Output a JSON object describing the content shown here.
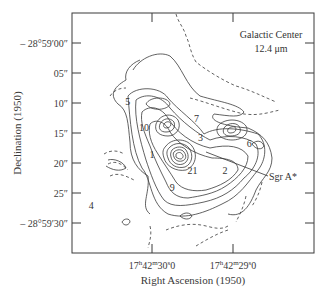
{
  "chart_data": {
    "type": "contour",
    "title": "Galactic Center",
    "subtitle": "12.4 μm",
    "xlabel": "Right Ascension (1950)",
    "ylabel": "Declination (1950)",
    "x_ticks": [
      {
        "label": "17h42m30s0",
        "sup_h": "h",
        "sup_m": "m",
        "sup_s": "s",
        "display": [
          "17",
          "h",
          "42",
          "m",
          "30",
          "s",
          "0"
        ],
        "ra_seconds": 30.0
      },
      {
        "label": "17h42m29s0",
        "display": [
          "17",
          "h",
          "42",
          "m",
          "29",
          "s",
          "0"
        ],
        "ra_seconds": 29.0
      }
    ],
    "y_ticks": [
      {
        "label": "– 28°59′00″",
        "dec_arcsec": 0
      },
      {
        "label": "05″",
        "dec_arcsec": 5
      },
      {
        "label": "10″",
        "dec_arcsec": 10
      },
      {
        "label": "15″",
        "dec_arcsec": 15
      },
      {
        "label": "20″",
        "dec_arcsec": 20
      },
      {
        "label": "25″",
        "dec_arcsec": 25
      },
      {
        "label": "– 28°59′30″",
        "dec_arcsec": 30
      }
    ],
    "xlim_ra_seconds": [
      30.95,
      28.3
    ],
    "ylim_dec_arcsec": [
      -5,
      35
    ],
    "annotations": [
      {
        "text": "Sgr A*",
        "points_to": {
          "ra_s": 29.6,
          "dec_as": 17.2
        }
      },
      {
        "text": "Galactic Center"
      },
      {
        "text": "12.4 μm"
      }
    ],
    "source_labels": [
      {
        "id": "1",
        "ra_s": 30.0,
        "dec_as": 18.5
      },
      {
        "id": "2",
        "ra_s": 29.1,
        "dec_as": 21.3
      },
      {
        "id": "3",
        "ra_s": 29.4,
        "dec_as": 15.8
      },
      {
        "id": "4",
        "ra_s": 30.75,
        "dec_as": 27.0
      },
      {
        "id": "5",
        "ra_s": 30.3,
        "dec_as": 9.8
      },
      {
        "id": "6",
        "ra_s": 28.8,
        "dec_as": 16.8
      },
      {
        "id": "7",
        "ra_s": 29.45,
        "dec_as": 12.5
      },
      {
        "id": "9",
        "ra_s": 29.75,
        "dec_as": 24.0
      },
      {
        "id": "10",
        "ra_s": 30.1,
        "dec_as": 14.0
      },
      {
        "id": "21",
        "ra_s": 29.5,
        "dec_as": 21.3
      }
    ],
    "grid": false,
    "legend": "none"
  }
}
